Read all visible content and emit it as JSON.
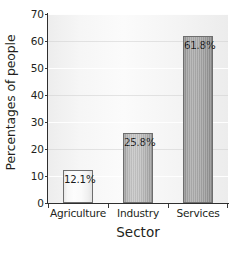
{
  "chart_data": {
    "type": "bar",
    "title": "",
    "categories": [
      "Agriculture",
      "Industry",
      "Services"
    ],
    "values": [
      12.1,
      25.8,
      61.8
    ],
    "value_labels": [
      "12.1%",
      "25.8%",
      "61.8%"
    ],
    "xlabel": "Sector",
    "ylabel": "Percentages of people",
    "ylim": [
      0,
      70
    ],
    "yticks": [
      0,
      10,
      20,
      30,
      40,
      50,
      60,
      70
    ],
    "ytick_labels": [
      "0",
      "10",
      "20",
      "30",
      "40",
      "50",
      "60",
      "70"
    ],
    "grid": true,
    "legend": false,
    "series": [
      {
        "name": "Percentages of people",
        "values": [
          12.1,
          25.8,
          61.8
        ]
      }
    ],
    "bar_colors": [
      "#fafafa",
      "#c2c2c2",
      "#a9a9a9"
    ],
    "axis_color": "#2f2f2f",
    "text_color": "#231f20",
    "plot_background": "#f6f6f6"
  }
}
